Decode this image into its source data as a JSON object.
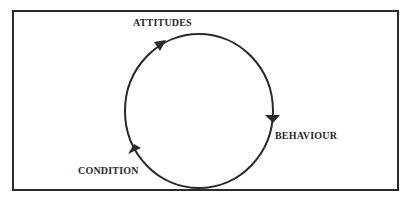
{
  "diagram": {
    "type": "cycle",
    "direction": "clockwise",
    "nodes": [
      {
        "id": "attitudes",
        "label": "ATTITUDES"
      },
      {
        "id": "behaviour",
        "label": "BEHAVIOUR"
      },
      {
        "id": "condition",
        "label": "CONDITION"
      }
    ],
    "edges": [
      {
        "from": "attitudes",
        "to": "behaviour"
      },
      {
        "from": "behaviour",
        "to": "condition"
      },
      {
        "from": "condition",
        "to": "attitudes"
      }
    ],
    "colors": {
      "stroke": "#2a2a2a",
      "background": "#ffffff"
    }
  }
}
